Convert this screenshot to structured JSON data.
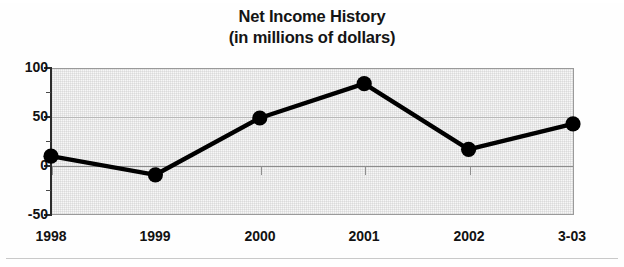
{
  "chart_data": {
    "type": "line",
    "title": "Net Income History",
    "subtitle": "(in millions of dollars)",
    "xlabel": "",
    "ylabel": "",
    "categories": [
      "1998",
      "1999",
      "2000",
      "2001",
      "2002",
      "3-03"
    ],
    "values": [
      10,
      -9,
      49,
      84,
      17,
      43
    ],
    "series": [
      {
        "name": "Net Income",
        "values": [
          10,
          -9,
          49,
          84,
          17,
          43
        ]
      }
    ],
    "ylim": [
      -50,
      100
    ],
    "yticks": [
      100,
      50,
      0,
      -50
    ],
    "ytick_labels": [
      "100",
      "50",
      "0",
      "-50"
    ],
    "yminor_ticks": [
      75,
      25,
      -25
    ],
    "grid": true,
    "gridlines_y": [
      50,
      0
    ],
    "legend": null,
    "legend_position": "none",
    "marker": "filled-circle",
    "line_color": "#000000",
    "marker_color": "#000000",
    "plot_background": "#f5f5f5",
    "axis_color": "#2b2b2b"
  },
  "colors": {
    "page_background": "#ffffff",
    "text": "#121212",
    "grid": "#b9b9b9",
    "plot_border": "#9a9a9a"
  }
}
